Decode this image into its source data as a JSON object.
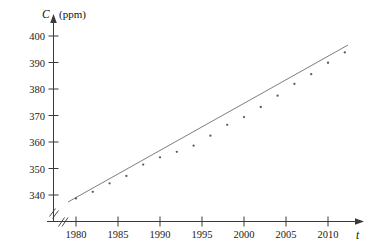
{
  "chart_data": {
    "type": "scatter",
    "title": "",
    "subtitle": "",
    "xlabel": "t",
    "ylabel": "C",
    "yunit": "(ppm)",
    "xlim": [
      1977.5,
      2013.5
    ],
    "ylim": [
      336,
      403
    ],
    "grid": false,
    "legend": null,
    "axis_break": true,
    "x_ticks": [
      1980,
      1985,
      1990,
      1995,
      2000,
      2005,
      2010
    ],
    "x_tick_labels": [
      "1980",
      "1985",
      "1990",
      "1995",
      "2000",
      "2005",
      "2010"
    ],
    "y_ticks": [
      340,
      350,
      360,
      370,
      380,
      390,
      400
    ],
    "y_tick_labels": [
      "340",
      "350",
      "360",
      "370",
      "380",
      "390",
      "400"
    ],
    "series": [
      {
        "name": "CO2 concentration",
        "marker": "point",
        "x": [
          1980,
          1982,
          1984,
          1986,
          1988,
          1990,
          1992,
          1994,
          1996,
          1998,
          2000,
          2002,
          2004,
          2006,
          2008,
          2010,
          2012
        ],
        "values": [
          338.7,
          341.2,
          344.4,
          347.2,
          351.5,
          354.2,
          356.3,
          358.6,
          362.4,
          366.5,
          369.4,
          373.2,
          377.5,
          381.9,
          385.6,
          389.9,
          393.8
        ]
      },
      {
        "name": "linear regression fit",
        "marker": "line",
        "x": [
          1979.2,
          2012.6
        ],
        "values": [
          337.7,
          395.0
        ]
      }
    ],
    "annotations": []
  },
  "axis": {
    "y_axis_title": "C",
    "y_axis_unit": "(ppm)",
    "x_axis_title": "t"
  }
}
